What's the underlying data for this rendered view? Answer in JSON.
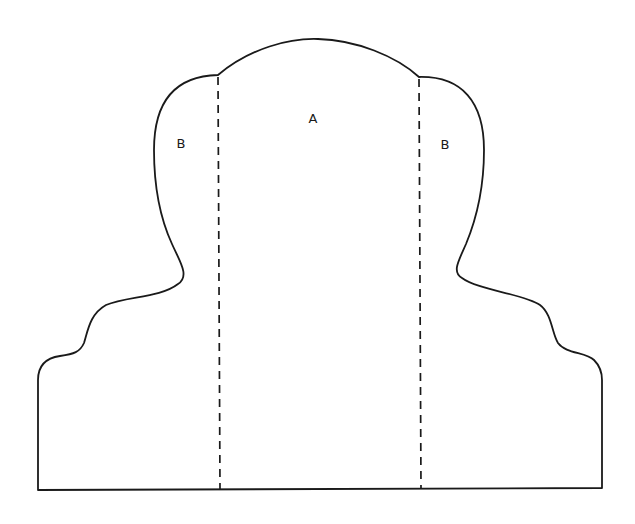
{
  "diagram": {
    "type": "sewing-pattern-piece",
    "stroke_color": "#1a1a1a",
    "background": "#ffffff",
    "regions": [
      {
        "id": "center",
        "label": "A",
        "x": 313,
        "y": 118
      },
      {
        "id": "left-side",
        "label": "B",
        "x": 181,
        "y": 143
      },
      {
        "id": "right-side",
        "label": "B",
        "x": 445,
        "y": 144
      }
    ],
    "fold_lines": [
      {
        "id": "left-fold",
        "x1": 218,
        "y1": 75,
        "x2": 220,
        "y2": 489
      },
      {
        "id": "right-fold",
        "x1": 419,
        "y1": 77,
        "x2": 421,
        "y2": 489
      }
    ]
  }
}
